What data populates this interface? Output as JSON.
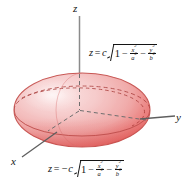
{
  "figure": {
    "background_color": "#ffffff",
    "axes": [
      {
        "name": "z",
        "label": "z"
      },
      {
        "name": "y",
        "label": "y"
      },
      {
        "name": "x",
        "label": "x"
      }
    ],
    "surface": {
      "name": "ellipsoid",
      "fill_light": "#f6cdcd",
      "fill_mid": "#ef9d9d",
      "fill_dark": "#e8615f",
      "outline_color": "#c34b4b",
      "hidden_edge_color": "#b8413f",
      "center_x": 80,
      "center_y": 110,
      "radius_x": 68,
      "radius_y": 37
    },
    "equations": {
      "upper": {
        "name": "upper-hemisphere-equation",
        "lhs": "z",
        "equals": "=",
        "coefficient": "c",
        "radicand_first": "1",
        "minus": "−",
        "term1_num": "x",
        "term1_den": "a",
        "term2_num": "y",
        "term2_den": "b",
        "exponent": "2",
        "plain": "z = c sqrt(1 - x^2/a^2 - y^2/b^2)"
      },
      "lower": {
        "name": "lower-hemisphere-equation",
        "lhs": "z",
        "equals": "=",
        "coefficient": "−c",
        "radicand_first": "1",
        "minus": "−",
        "term1_num": "x",
        "term1_den": "a",
        "term2_num": "y",
        "term2_den": "b",
        "exponent": "2",
        "plain": "z = -c sqrt(1 - x^2/a^2 - y^2/b^2)"
      }
    }
  }
}
